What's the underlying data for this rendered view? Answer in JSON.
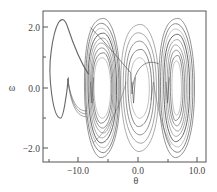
{
  "chart_data": {
    "type": "line",
    "title": "",
    "xlabel": "θ",
    "ylabel": "ω",
    "xlim": [
      -16.0,
      11.5
    ],
    "ylim": [
      -2.45,
      2.55
    ],
    "xticks": [
      -10.0,
      0.0,
      10.0
    ],
    "xtick_labels": [
      "-10.0",
      "0.0",
      "10.0"
    ],
    "x_minor_ticks": [
      -15.0,
      -5.0,
      5.0
    ],
    "yticks": [
      2.0,
      0.0,
      -2.0
    ],
    "ytick_labels": [
      "2.0",
      "0.0",
      "-2.0"
    ],
    "y_minor_ticks": [
      1.0,
      -1.0
    ],
    "grid": false,
    "legend": null,
    "line_color": "#5a5a5a",
    "series": [
      {
        "name": "lobe-left",
        "points": [
          [
            -11.8,
            0.3
          ],
          [
            -12.8,
            -0.2
          ],
          [
            -13.8,
            -0.7
          ],
          [
            -12.2,
            -1.0
          ],
          [
            -14.6,
            0.5
          ],
          [
            -14.0,
            1.6
          ],
          [
            -12.4,
            2.2
          ],
          [
            -10.5,
            1.6
          ],
          [
            -9.0,
            0.9
          ],
          [
            -8.2,
            0.4
          ]
        ]
      },
      {
        "name": "cluster-left",
        "center": [
          -6.0,
          0.0
        ],
        "theta_halfwidth": [
          1.4,
          3.0
        ],
        "omega_amplitude": [
          1.0,
          2.3
        ],
        "loops": 9
      },
      {
        "name": "cluster-middle",
        "center": [
          0.3,
          0.0
        ],
        "theta_halfwidth": [
          1.6,
          3.2
        ],
        "omega_amplitude": [
          1.0,
          2.1
        ],
        "loops": 5
      },
      {
        "name": "cluster-right",
        "center": [
          6.5,
          0.0
        ],
        "theta_halfwidth": [
          0.8,
          3.0
        ],
        "omega_amplitude": [
          0.9,
          2.3
        ],
        "loops": 9
      }
    ]
  },
  "axes": {
    "x_title": "θ",
    "y_title": "ω",
    "x_tick_labels": [
      "−10.0",
      "0.0",
      "10.0"
    ],
    "y_tick_labels": [
      "2.0",
      "0.0",
      "−2.0"
    ]
  }
}
